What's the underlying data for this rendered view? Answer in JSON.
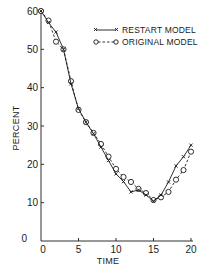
{
  "chart_data": {
    "type": "line",
    "title": "",
    "xlabel": "TIME",
    "ylabel": "PERCENT",
    "xlim": [
      0,
      20
    ],
    "ylim": [
      0,
      60
    ],
    "x_ticks": [
      0,
      5,
      10,
      15,
      20
    ],
    "y_ticks": [
      0,
      10,
      20,
      30,
      40,
      50,
      60
    ],
    "x_tick_labels": [
      "0",
      "5",
      "10",
      "15",
      "20"
    ],
    "y_tick_labels": [
      "0",
      "10",
      "20",
      "30",
      "40",
      "50",
      "60"
    ],
    "grid": false,
    "legend_position": "upper right",
    "x": [
      0,
      1,
      2,
      3,
      4,
      5,
      6,
      7,
      8,
      9,
      10,
      11,
      12,
      13,
      14,
      15,
      16,
      17,
      18,
      19,
      20
    ],
    "series": [
      {
        "name": "RESTART MODEL",
        "marker": "x",
        "line_style": "solid",
        "values": [
          60,
          57,
          54.5,
          50,
          41,
          34.5,
          31,
          28,
          24.5,
          21,
          17.5,
          15.5,
          12.8,
          13.3,
          12,
          10.4,
          12,
          15.4,
          19.6,
          22,
          25
        ]
      },
      {
        "name": "ORIGINAL MODEL",
        "marker": "o",
        "line_style": "dashed",
        "values": [
          60,
          57.5,
          52,
          50,
          41.7,
          34.2,
          31,
          28.2,
          25.3,
          22,
          18.8,
          16.7,
          15.4,
          13.6,
          12.5,
          10.7,
          11.4,
          12.8,
          16,
          18.5,
          23.3
        ]
      }
    ]
  },
  "axes": {
    "xlabel": "TIME",
    "ylabel": "PERCENT",
    "origin_label": "0"
  },
  "legend": {
    "restart_label": "RESTART MODEL",
    "original_label": "ORIGINAL MODEL"
  },
  "colors": {
    "ink": "#1a1a1a",
    "background": "#ffffff"
  }
}
